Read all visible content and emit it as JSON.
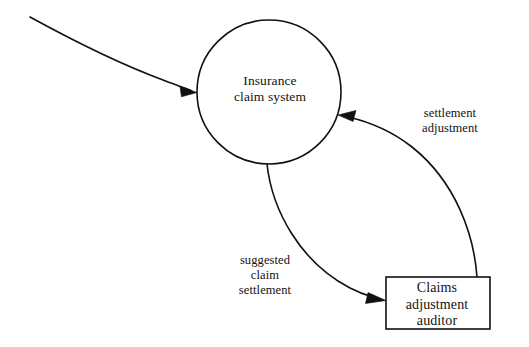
{
  "diagram": {
    "type": "data-flow-diagram",
    "background_color": "#ffffff",
    "line_color": "#111111",
    "text_color": "#15120f"
  },
  "nodes": {
    "process": {
      "shape": "circle",
      "label": "Insurance\nclaim system",
      "label_line_1": "Insurance",
      "label_line_2": "claim system",
      "center_x": 269,
      "center_y": 92,
      "radius": 72
    },
    "external_entity": {
      "shape": "rectangle",
      "label": "Claims\nadjustment\nauditor",
      "label_line_1": "Claims",
      "label_line_2": "adjustment",
      "label_line_3": "auditor",
      "x": 386,
      "y": 277,
      "width": 104,
      "height": 52
    }
  },
  "flows": [
    {
      "name": "unlabeled-input-flow",
      "label": "",
      "from": "off-diagram-top-left",
      "to": "process",
      "direction": "into-process"
    },
    {
      "name": "suggested-claim-settlement-flow",
      "label": "suggested\nclaim\nsettlement",
      "label_line_1": "suggested",
      "label_line_2": "claim",
      "label_line_3": "settlement",
      "from": "process",
      "to": "external_entity",
      "direction": "process-to-entity"
    },
    {
      "name": "settlement-adjustment-flow",
      "label": "settlement\nadjustment",
      "label_line_1": "settlement",
      "label_line_2": "adjustment",
      "from": "external_entity",
      "to": "process",
      "direction": "entity-to-process"
    }
  ]
}
